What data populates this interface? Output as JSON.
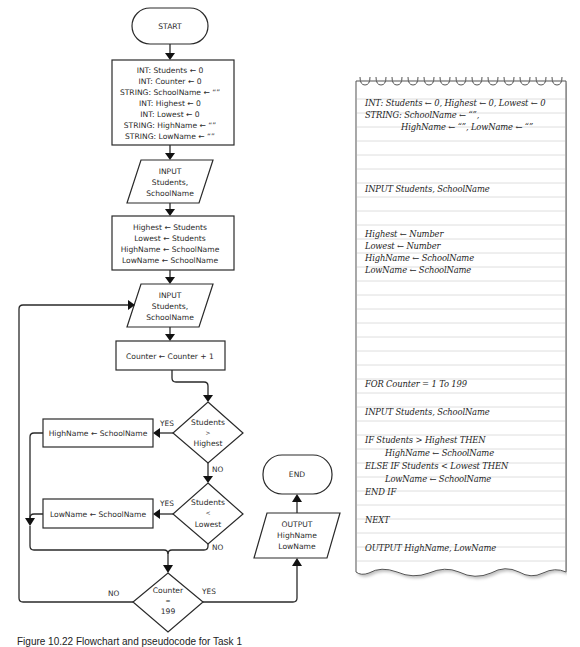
{
  "flowchart": {
    "start": "START",
    "init_block": [
      "INT: Students ← 0",
      "INT: Counter ← 0",
      "STRING: SchoolName ← “”",
      "INT: Highest ← 0",
      "INT: Lowest ← 0",
      "STRING: HighName ← “”",
      "STRING: LowName ← “”"
    ],
    "input1": [
      "INPUT",
      "Students,",
      "SchoolName"
    ],
    "assign_block": [
      "Highest ← Students",
      "Lowest ← Students",
      "HighName ← SchoolName",
      "LowName ← SchoolName"
    ],
    "input2": [
      "INPUT",
      "Students,",
      "SchoolName"
    ],
    "counter_increment": "Counter ← Counter + 1",
    "decision_highest": [
      "Students",
      ">",
      "Highest"
    ],
    "decision_lowest": [
      "Students",
      "<",
      "Lowest"
    ],
    "decision_counter": [
      "Counter",
      "=",
      "199"
    ],
    "highname_assign": "HighName ← SchoolName",
    "lowname_assign": "LowName ← SchoolName",
    "output": [
      "OUTPUT",
      "HighName",
      "LowName"
    ],
    "end": "END",
    "labels": {
      "yes": "YES",
      "no": "NO"
    }
  },
  "pseudocode": {
    "lines": [
      "INT: Students ← 0, Highest ← 0, Lowest ← 0",
      "STRING: SchoolName ← “”,",
      "HighName ← “”, LowName ← “”",
      "INPUT Students, SchoolName",
      "Highest ← Number",
      "Lowest ← Number",
      "HighName ← SchoolName",
      "LowName ← SchoolName",
      "FOR Counter = 1 To 199",
      "INPUT Students, SchoolName",
      "IF Students > Highest THEN",
      "HighName ← SchoolName",
      "ELSE IF Students < Lowest THEN",
      "LowName ← SchoolName",
      "END IF",
      "NEXT",
      "OUTPUT HighName, LowName"
    ]
  },
  "caption": "Figure 10.22  Flowchart and pseudocode for Task 1"
}
